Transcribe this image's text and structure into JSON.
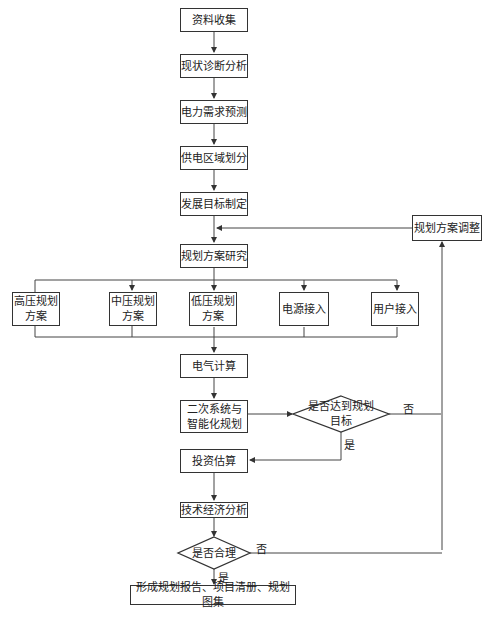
{
  "flowchart": {
    "steps": {
      "s1": "资料收集",
      "s2": "现状诊断分析",
      "s3": "电力需求预测",
      "s4": "供电区域划分",
      "s5": "发展目标制定",
      "s6": "规划方案研究",
      "adjust": "规划方案调整",
      "branch_hv_line1": "高压规划",
      "branch_hv_line2": "方案",
      "branch_mv_line1": "中压规划",
      "branch_mv_line2": "方案",
      "branch_lv_line1": "低压规划",
      "branch_lv_line2": "方案",
      "branch_power": "电源接入",
      "branch_user": "用户接入",
      "s7": "电气计算",
      "s8_line1": "二次系统与",
      "s8_line2": "智能化规划",
      "s9": "投资估算",
      "s10": "技术经济分析",
      "final": "形成规划报告、项目清册、规划图集"
    },
    "decisions": {
      "d1_line1": "是否达到规划",
      "d1_line2": "目标",
      "d2": "是否合理"
    },
    "edge_labels": {
      "d1_no": "否",
      "d1_yes": "是",
      "d2_no": "否",
      "d2_yes": "是"
    }
  }
}
